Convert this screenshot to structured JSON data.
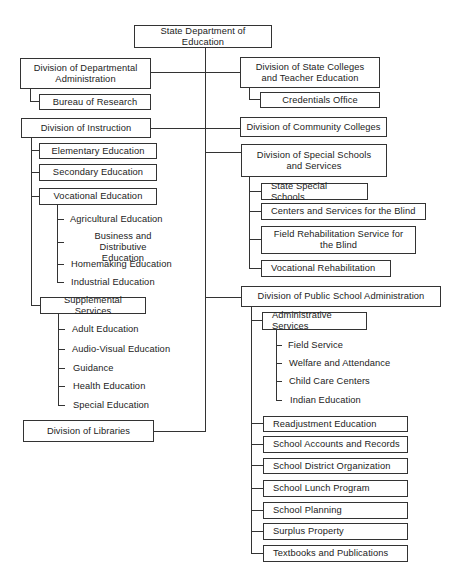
{
  "chart": {
    "title": "State Department of Education",
    "left": {
      "dept_admin": {
        "label": "Division of Departmental Administration",
        "line1": "Division of Departmental",
        "line2": "Administration",
        "children": [
          "Bureau of Research"
        ]
      },
      "instruction": {
        "label": "Division of Instruction",
        "units": [
          "Elementary Education",
          "Secondary Education",
          "Vocational Education",
          "Supplemental Services"
        ],
        "vocational_items": [
          "Agricultural Education",
          "Business and Distributive Education",
          "Homemaking Education",
          "Industrial Education"
        ],
        "business_line1": "Business and Distributive",
        "business_line2": "Education",
        "supplemental_items": [
          "Adult Education",
          "Audio-Visual Education",
          "Guidance",
          "Health Education",
          "Special Education"
        ]
      },
      "libraries": {
        "label": "Division of Libraries"
      }
    },
    "right": {
      "state_colleges": {
        "label": "Division of State Colleges and Teacher Education",
        "line1": "Division of State Colleges",
        "line2": "and Teacher Education",
        "children": [
          "Credentials Office"
        ]
      },
      "community_colleges": {
        "label": "Division of Community Colleges"
      },
      "special_schools": {
        "label": "Division of Special Schools and Services",
        "line1": "Division of Special Schools",
        "line2": "and Services",
        "children": [
          "State Special Schools",
          "Centers and Services for the Blind",
          "Field Rehabilitation Service for the Blind",
          "Vocational Rehabilitation"
        ],
        "field_line1": "Field Rehabilitation Service for",
        "field_line2": "the Blind"
      },
      "public_school_admin": {
        "label": "Division of Public School Administration",
        "admin_services": "Administrative Services",
        "admin_services_items": [
          "Field Service",
          "Welfare and Attendance",
          "Child Care Centers",
          "Indian Education"
        ],
        "units": [
          "Readjustment Education",
          "School Accounts and Records",
          "School District Organization",
          "School Lunch Program",
          "School Planning",
          "Surplus Property",
          "Textbooks and Publications"
        ]
      }
    }
  }
}
